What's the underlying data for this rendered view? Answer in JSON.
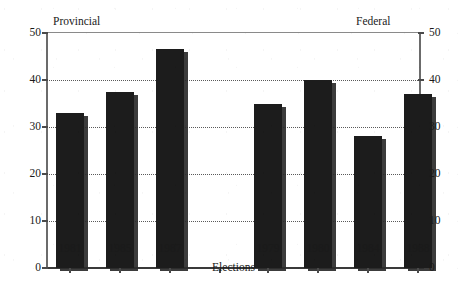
{
  "chart_data": {
    "type": "bar",
    "title": "",
    "xlabel": "Elections",
    "ylabel": "",
    "ylim": [
      0,
      50
    ],
    "yticks": [
      0,
      10,
      20,
      30,
      40,
      50
    ],
    "grid": true,
    "grid_style": "dotted horizontal",
    "legend": "none",
    "axis_left_label": "Provincial",
    "axis_right_label": "Federal",
    "dual_axis": true,
    "categories": [
      "1981",
      "1985",
      "1987",
      "1979",
      "1980",
      "1984",
      "1988"
    ],
    "values": [
      33,
      37.5,
      46.5,
      35,
      40,
      28,
      37
    ],
    "groups": [
      {
        "name": "Provincial",
        "categories": [
          "1981",
          "1985",
          "1987"
        ],
        "values": [
          33,
          37.5,
          46.5
        ]
      },
      {
        "name": "Federal",
        "categories": [
          "1979",
          "1980",
          "1984",
          "1988"
        ],
        "values": [
          35,
          40,
          28,
          37
        ]
      }
    ],
    "bar_color": "#1c1c1c"
  },
  "axes": {
    "left": {
      "name": "Provincial",
      "ticks": [
        "50",
        "40",
        "30",
        "20",
        "10",
        "0"
      ]
    },
    "right": {
      "name": "Federal",
      "ticks": [
        "50",
        "40",
        "30",
        "20",
        "10",
        "0"
      ]
    }
  },
  "xaxis": {
    "title": "Elections",
    "ticks": [
      "1981",
      "1985",
      "1987",
      "1979",
      "1980",
      "1984",
      "1988"
    ]
  },
  "colors": {
    "bar": "#1c1c1c",
    "bar_shadow": "#2b2b2b",
    "axis": "#6b6b6b",
    "grid": "#5a5a5a",
    "text": "#1a1a1a",
    "background": "#ffffff"
  }
}
